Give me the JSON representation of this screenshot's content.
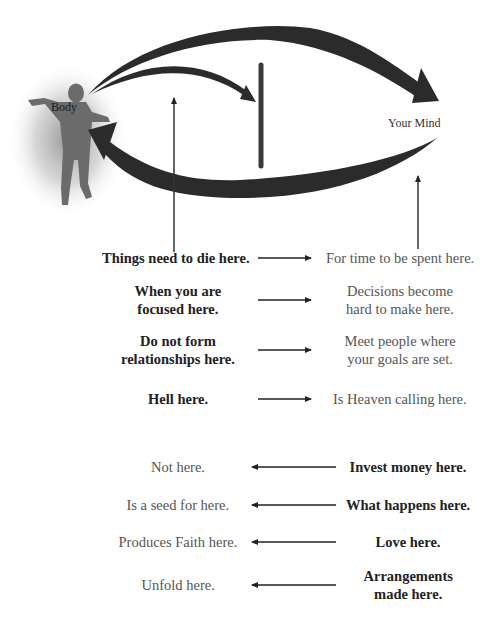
{
  "header": {
    "cut_off_title": "...pure your thoughts..."
  },
  "diagram": {
    "body_label": "Body",
    "mind_label": "Your Mind",
    "colors": {
      "arrow": "#2b2b2b",
      "figure": "#6b6b6b",
      "glow": "#9a9a9a",
      "bold_text": "#222222",
      "light_text": "#555555"
    }
  },
  "forward_rows": [
    {
      "left": "Things need to die here.",
      "right": "For time to be spent here.",
      "direction": "right"
    },
    {
      "left": "When you are\nfocused here.",
      "right": "Decisions become\nhard to make here.",
      "direction": "right"
    },
    {
      "left": "Do not form\nrelationships here.",
      "right": "Meet people where\nyour goals are set.",
      "direction": "right"
    },
    {
      "left": "Hell here.",
      "right": "Is Heaven calling here.",
      "direction": "right"
    }
  ],
  "reverse_rows": [
    {
      "left": "Not here.",
      "right": "Invest money here.",
      "direction": "left"
    },
    {
      "left": "Is a seed for here.",
      "right": "What happens here.",
      "direction": "left"
    },
    {
      "left": "Produces Faith here.",
      "right": "Love here.",
      "direction": "left"
    },
    {
      "left": "Unfold here.",
      "right": "Arrangements\nmade here.",
      "direction": "left"
    }
  ]
}
